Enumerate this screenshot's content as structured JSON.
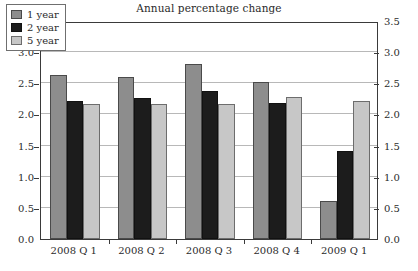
{
  "chart_data": {
    "type": "bar",
    "title": "Annual percentage change",
    "xlabel": "",
    "ylabel": "",
    "ylim": [
      0.0,
      3.5
    ],
    "ytick_step": 0.5,
    "ytick_labels": [
      "0.0",
      "0.5",
      "1.0",
      "1.5",
      "2.0",
      "2.5",
      "3.0",
      "3.5"
    ],
    "grid": true,
    "dual_y_axis": true,
    "legend_position": "top-left-inside",
    "categories": [
      "2008 Q 1",
      "2008 Q 2",
      "2008 Q 3",
      "2008 Q 4",
      "2009 Q 1"
    ],
    "series": [
      {
        "name": "1 year",
        "color": "#8d8d8d",
        "values": [
          2.64,
          2.6,
          2.81,
          2.52,
          0.61
        ]
      },
      {
        "name": "2 year",
        "color": "#1c1c1c",
        "values": [
          2.22,
          2.27,
          2.38,
          2.18,
          1.42
        ]
      },
      {
        "name": "5 year",
        "color": "#c7c7c7",
        "values": [
          2.17,
          2.16,
          2.17,
          2.28,
          2.22
        ]
      }
    ]
  }
}
